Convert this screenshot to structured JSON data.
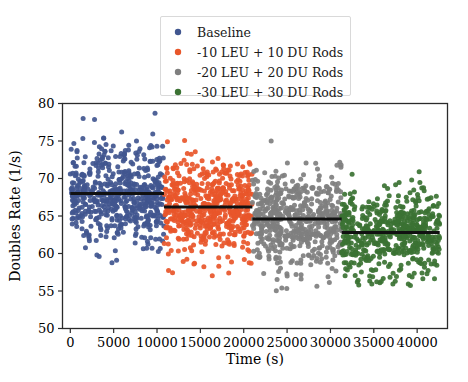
{
  "chart_data": {
    "type": "scatter",
    "title": "",
    "xlabel": "Time (s)",
    "ylabel": "Doubles Rate (1/s)",
    "xlim": [
      -900,
      43500
    ],
    "ylim": [
      50,
      80
    ],
    "xticks": [
      0,
      5000,
      10000,
      15000,
      20000,
      25000,
      30000,
      35000,
      40000
    ],
    "xticklabels": [
      "0",
      "5000",
      "10000",
      "15000",
      "20000",
      "25000",
      "30000",
      "35000",
      "40000"
    ],
    "yticks": [
      50,
      55,
      60,
      65,
      70,
      75,
      80
    ],
    "yticklabels": [
      "50",
      "55",
      "60",
      "65",
      "70",
      "75",
      "80"
    ],
    "grid": false,
    "legend_position": "upper center",
    "series": [
      {
        "name": "Baseline",
        "color": "#41568f",
        "x_range": [
          0,
          10800
        ],
        "mean": 68.0,
        "mean_line": {
          "x_start": 0,
          "x_end": 10800,
          "y": 68.0
        },
        "n_points": 560,
        "spread_sd": 3.3,
        "y_min": 58.6,
        "y_max": 79.2
      },
      {
        "name": "-10 LEU + 10 DU Rods",
        "color": "#e8562a",
        "x_range": [
          10800,
          21000
        ],
        "mean": 66.2,
        "mean_line": {
          "x_start": 10800,
          "x_end": 21000,
          "y": 66.2
        },
        "n_points": 560,
        "spread_sd": 3.2,
        "y_min": 56.8,
        "y_max": 77.0
      },
      {
        "name": "-20 LEU + 20 DU Rods",
        "color": "#7f7f7f",
        "x_range": [
          21000,
          31300
        ],
        "mean": 64.6,
        "mean_line": {
          "x_start": 21000,
          "x_end": 31300,
          "y": 64.6
        },
        "n_points": 560,
        "spread_sd": 3.1,
        "y_min": 54.8,
        "y_max": 75.6
      },
      {
        "name": "-30 LEU + 30 DU Rods",
        "color": "#3b7233",
        "x_range": [
          31300,
          42600
        ],
        "mean": 62.8,
        "mean_line": {
          "x_start": 31300,
          "x_end": 42600,
          "y": 62.8
        },
        "n_points": 560,
        "spread_sd": 3.0,
        "y_min": 55.6,
        "y_max": 74.8
      }
    ],
    "legend_entries": [
      {
        "label": "Baseline",
        "color": "#41568f"
      },
      {
        "label": "-10 LEU + 10 DU Rods",
        "color": "#e8562a"
      },
      {
        "label": "-20 LEU + 20 DU Rods",
        "color": "#7f7f7f"
      },
      {
        "label": "-30 LEU + 30 DU Rods",
        "color": "#3b7233"
      }
    ]
  }
}
